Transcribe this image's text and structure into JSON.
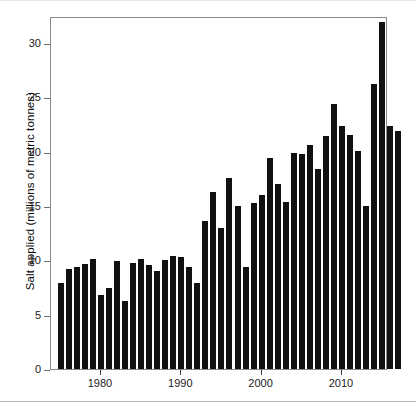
{
  "chart_data": {
    "type": "bar",
    "title": "",
    "xlabel": "",
    "ylabel": "Salt applied (millions of metric tonnes)",
    "ylim": [
      0,
      33
    ],
    "xlim": [
      1974.3,
      2017.7
    ],
    "grid": false,
    "legend": null,
    "y_ticks": [
      0,
      5,
      10,
      15,
      20,
      25,
      30
    ],
    "y_tick_labels": [
      "0",
      "5",
      "10",
      "15",
      "20",
      "25",
      "30"
    ],
    "x_ticks": [
      1980,
      1990,
      2000,
      2010
    ],
    "x_tick_labels": [
      "1980",
      "1990",
      "2000",
      "2010"
    ],
    "bar_color": "#111111",
    "categories": [
      "1975",
      "1976",
      "1977",
      "1978",
      "1979",
      "1980",
      "1981",
      "1982",
      "1983",
      "1984",
      "1985",
      "1986",
      "1987",
      "1988",
      "1989",
      "1990",
      "1991",
      "1992",
      "1993",
      "1994",
      "1995",
      "1996",
      "1997",
      "1998",
      "1999",
      "2000",
      "2001",
      "2002",
      "2003",
      "2004",
      "2005",
      "2006",
      "2007",
      "2008",
      "2009",
      "2010",
      "2011",
      "2012",
      "2013",
      "2014",
      "2015",
      "2016",
      "2017"
    ],
    "values": [
      7.9,
      9.2,
      9.4,
      9.7,
      10.1,
      6.8,
      7.5,
      9.9,
      6.3,
      9.8,
      10.1,
      9.6,
      9.0,
      10.0,
      10.4,
      10.3,
      9.4,
      7.9,
      13.6,
      16.3,
      13.0,
      17.6,
      15.0,
      9.4,
      15.3,
      16.0,
      19.4,
      17.0,
      15.4,
      19.9,
      19.8,
      20.6,
      18.4,
      21.4,
      24.4,
      22.4,
      21.5,
      20.1,
      15.0,
      26.2,
      31.9,
      22.4,
      21.9
    ]
  }
}
